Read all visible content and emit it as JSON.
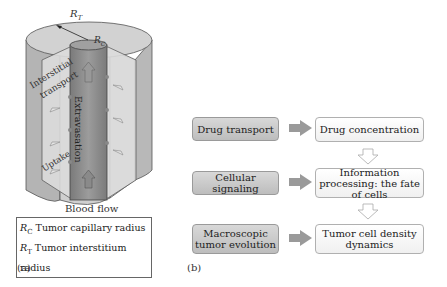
{
  "panel_a": {
    "labels": {
      "rt": "R",
      "rt_sub": "T",
      "rc": "R",
      "rc_sub": "C",
      "interstitial": "Interstitial",
      "transport": "transport",
      "extravasation": "Extravasation",
      "uptake": "Uptake",
      "blood_flow": "Blood flow"
    },
    "legend": [
      {
        "symbol": "R",
        "sub": "C",
        "text": "Tumor capillary radius"
      },
      {
        "symbol": "R",
        "sub": "T",
        "text": "Tumor interstitium radius"
      }
    ],
    "panel_label": "(a)"
  },
  "panel_b": {
    "rows": [
      {
        "left": "Drug transport",
        "right": "Drug concentration"
      },
      {
        "left": "Cellular signaling",
        "right": "Information processing: the fate of cells"
      },
      {
        "left": "Macroscopic tumor evolution",
        "right": "Tumor cell density dynamics"
      }
    ],
    "panel_label": "(b)"
  },
  "colors": {
    "outer_cylinder": "#c8c8c8",
    "inner_capillary": "#8a8a8a",
    "left_box": "#c8c8c8",
    "right_box": "#f8f8f8",
    "arrow": "#9a9a9a"
  }
}
